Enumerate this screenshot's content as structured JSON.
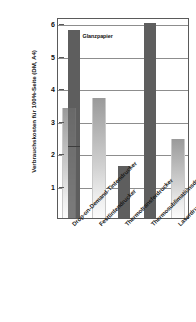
{
  "chart_data": {
    "type": "bar",
    "title": "",
    "xlabel": "",
    "ylabel": "Verbrauchskosten für 100%-Seite (DM, A4)",
    "ylim": [
      0,
      6.2
    ],
    "yticks": [
      1,
      2,
      3,
      4,
      5,
      6
    ],
    "ytick_labels": [
      "1",
      "2",
      "3",
      "4",
      "5",
      "6"
    ],
    "grid": true,
    "legend": false,
    "annotations": [
      {
        "text": "Glanzpapier",
        "target_series": "Glanzpapier",
        "target_category": "Drop-on-Demand-Tintendrucker"
      }
    ],
    "categories": [
      "Drop-on-Demand-Tintendrucker",
      "Festtintendrucker",
      "Thermotransferdrucker",
      "Thermosublimationsdrucker",
      "Laserdrucker"
    ],
    "series": [
      {
        "name": "Normalpapier",
        "color": "#c0c0c0",
        "values": [
          3.4,
          3.7,
          null,
          null,
          2.45
        ]
      },
      {
        "name": "Glanzpapier",
        "color": "#5e5e5e",
        "values": [
          5.8,
          null,
          1.6,
          6.0,
          null
        ]
      }
    ],
    "notes": {
      "segment_boundary_category": "Drop-on-Demand-Tintendrucker",
      "segment_boundary_value": 2.2
    }
  },
  "axis": {
    "y_title": "Verbrauchskosten für 100%-Seite (DM, A4)",
    "y_ticks": [
      {
        "label": "6",
        "value": 6
      },
      {
        "label": "5",
        "value": 5
      },
      {
        "label": "4",
        "value": 4
      },
      {
        "label": "3",
        "value": 3
      },
      {
        "label": "2",
        "value": 2
      },
      {
        "label": "1",
        "value": 1
      }
    ],
    "x_ticks": [
      {
        "label": "Drop-on-Demand-Tintendrucker"
      },
      {
        "label": "Festtintendrucker"
      },
      {
        "label": "Thermotransferdrucker"
      },
      {
        "label": "Thermosublimationsdrucker"
      },
      {
        "label": "Laserdrucker"
      }
    ]
  },
  "annotation": {
    "glanzpapier": "Glanzpapier"
  },
  "colors": {
    "bar_dark": "#5e5e5e",
    "bar_light": "#c0c0c0",
    "gridline": "#8d8d8d",
    "axis": "#5a5a5a",
    "text": "#111111",
    "background": "#ffffff"
  }
}
